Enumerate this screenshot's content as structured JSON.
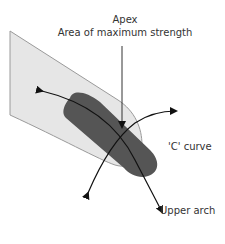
{
  "diagram": {
    "labels": {
      "apex_title": "Apex",
      "apex_subtitle": "Area of maximum strength",
      "c_curve": "'C' curve",
      "upper_arch": "Upper arch"
    },
    "colors": {
      "finger_fill": "#e6e6e6",
      "finger_stroke": "#9a9a9a",
      "nail_fill": "#555555",
      "arrow": "#111111",
      "text": "#333333"
    }
  }
}
